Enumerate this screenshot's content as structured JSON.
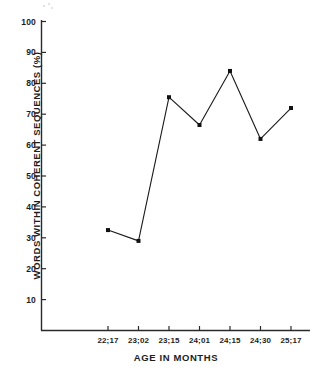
{
  "chart_data": {
    "type": "line",
    "title": "",
    "xlabel": "AGE IN MONTHS",
    "ylabel": "WORDS WITHIN COHERENT SEQUENCES (%)",
    "categories": [
      "22;17",
      "23;02",
      "23;15",
      "24;01",
      "24;15",
      "24;30",
      "25;17"
    ],
    "values": [
      32.5,
      29,
      75.5,
      66.5,
      84,
      62,
      72
    ],
    "series": [
      {
        "name": "words within coherent sequences",
        "values": [
          32.5,
          29,
          75.5,
          66.5,
          84,
          62,
          72
        ]
      }
    ],
    "ylim": [
      0,
      100
    ],
    "ytick_labels": [
      "10",
      "20",
      "30",
      "40",
      "50",
      "60",
      "70",
      "80",
      "90",
      "100"
    ],
    "ytick_values": [
      10,
      20,
      30,
      40,
      50,
      60,
      70,
      80,
      90,
      100
    ],
    "grid": false,
    "legend": false,
    "legend_position": "none",
    "marker": "square",
    "line_color": "#1a1a1a",
    "marker_color": "#111111",
    "axis_color": "#2a2a2a",
    "background_color": "#ffffff"
  }
}
